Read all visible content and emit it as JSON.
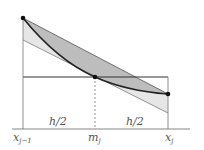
{
  "labels": {
    "x_left": "x",
    "x_left_sub": "j−1",
    "m_mid": "m",
    "m_mid_sub": "j",
    "x_right": "x",
    "x_right_sub": "j",
    "half_left": "h/2",
    "half_right": "h/2"
  },
  "colors": {
    "dark_fill": "#bdbdbd",
    "light_fill": "#e6e6e6",
    "line": "#333333",
    "axis": "#666666"
  }
}
